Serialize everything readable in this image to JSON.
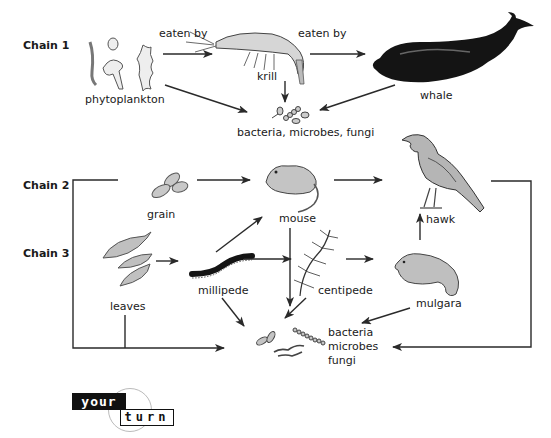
{
  "header": {
    "faded_text": ""
  },
  "chains": [
    {
      "id": "chain1",
      "label": "Chain 1"
    },
    {
      "id": "chain2",
      "label": "Chain 2"
    },
    {
      "id": "chain3",
      "label": "Chain 3"
    }
  ],
  "organisms": {
    "phytoplankton": "phytoplankton",
    "krill": "krill",
    "whale": "whale",
    "decomposers_chain1": "bacteria, microbes, fungi",
    "grain": "grain",
    "mouse": "mouse",
    "hawk": "hawk",
    "leaves": "leaves",
    "millipede": "millipede",
    "centipede": "centipede",
    "mulgara": "mulgara",
    "decomposers_bottom": [
      "bacteria",
      "microbes",
      "fungi"
    ]
  },
  "relations": {
    "eaten_by_1": "eaten by",
    "eaten_by_2": "eaten by"
  },
  "badge": {
    "your": "your",
    "turn": "turn"
  },
  "colors": {
    "line": "#2a2a2a",
    "illustration_gray": "#9a9a9a",
    "whale": "#111111",
    "badge_bg": "#111111"
  }
}
